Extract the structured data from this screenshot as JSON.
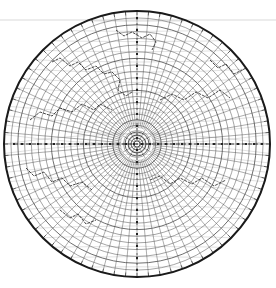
{
  "map": {
    "projection": "azimuthal",
    "center": [
      137,
      144
    ],
    "radius": 133,
    "colors": {
      "background": "#ffffff",
      "grid": "#4a4a4a",
      "border": "#1a1a1a",
      "coast": "#333333",
      "scale": "#222222"
    },
    "rings": 22,
    "spokes": 72,
    "grid_curves": 28,
    "coastlines": [
      "M52,62 L60,58 L70,66 L78,62 L86,70 L96,66 L104,74 L112,72 L120,80 L118,90 L126,96 L132,92",
      "M30,120 L40,112 L52,116 L60,108 L72,112 L82,104 L94,110 L100,104 L112,110",
      "M26,168 L34,176 L44,172 L52,182 L62,178 L70,186 L82,182 L92,190",
      "M150,180 L160,176 L170,184 L180,178 L192,184 L202,178 L214,186 L226,180",
      "M160,100 L172,94 L184,100 L196,92 L208,98 L220,90 L230,98",
      "M116,30 L124,36 L132,32 L142,38 L150,34 L156,42 L152,50",
      "M210,60 L218,68 L226,64 L234,74 L242,70",
      "M60,210 L70,218 L78,214 L86,224 L96,220"
    ],
    "scale_axis": {
      "horizontal": [
        14,
        144,
        262,
        144
      ],
      "vertical": [
        137,
        18,
        137,
        272
      ]
    }
  }
}
